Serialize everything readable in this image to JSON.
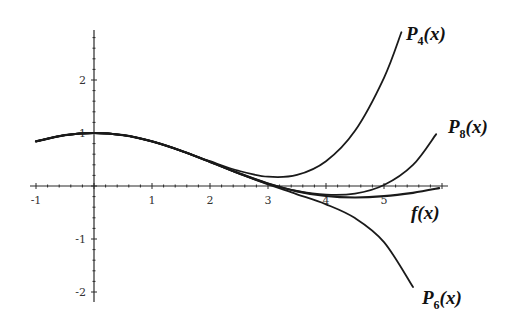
{
  "chart_data": {
    "type": "line",
    "title": "",
    "xlabel": "",
    "ylabel": "",
    "xlim": [
      -1,
      6
    ],
    "ylim": [
      -2,
      2.9
    ],
    "grid": false,
    "x_ticks": [
      -1,
      1,
      2,
      3,
      4,
      5
    ],
    "y_ticks": [
      2,
      1,
      -1,
      -2
    ],
    "x_tick_labels": [
      "-1",
      "1",
      "2",
      "3",
      "4",
      "5"
    ],
    "y_tick_labels": [
      "2",
      "1",
      "-1",
      "-2"
    ],
    "series": [
      {
        "name": "f(x)",
        "label_base": "f",
        "label_sub": "",
        "label_tail": "(x)",
        "x": [
          -1,
          -0.5,
          0,
          0.5,
          1,
          1.5,
          2,
          2.5,
          3,
          3.5,
          4,
          4.5,
          5,
          5.5,
          5.95
        ],
        "values": [
          0.841,
          0.959,
          1,
          0.959,
          0.841,
          0.665,
          0.455,
          0.239,
          0.047,
          -0.1,
          -0.189,
          -0.217,
          -0.192,
          -0.128,
          -0.04
        ]
      },
      {
        "name": "P4(x)",
        "label_base": "P",
        "label_sub": "4",
        "label_tail": "(x)",
        "x": [
          -1,
          -0.5,
          0,
          0.5,
          1,
          1.5,
          2,
          2.5,
          3,
          3.5,
          4,
          4.5,
          5,
          5.3
        ],
        "values": [
          0.842,
          0.959,
          1,
          0.959,
          0.842,
          0.667,
          0.467,
          0.284,
          0.175,
          0.209,
          0.467,
          1.042,
          2.042,
          2.9
        ]
      },
      {
        "name": "P6(x)",
        "label_base": "P",
        "label_sub": "6",
        "label_tail": "(x)",
        "x": [
          -1,
          -0.5,
          0,
          0.5,
          1,
          1.5,
          2,
          2.5,
          3,
          3.5,
          4,
          4.5,
          5,
          5.5
        ],
        "values": [
          0.841,
          0.959,
          1,
          0.959,
          0.841,
          0.665,
          0.454,
          0.234,
          0.03,
          -0.156,
          -0.346,
          -0.606,
          -1.058,
          -1.908
        ]
      },
      {
        "name": "P8(x)",
        "label_base": "P",
        "label_sub": "8",
        "label_tail": "(x)",
        "x": [
          -1,
          -0.5,
          0,
          0.5,
          1,
          1.5,
          2,
          2.5,
          3,
          3.5,
          4,
          4.5,
          5,
          5.5,
          5.9
        ],
        "values": [
          0.841,
          0.959,
          1,
          0.959,
          0.841,
          0.665,
          0.455,
          0.239,
          0.048,
          -0.094,
          -0.165,
          -0.143,
          0.018,
          0.399,
          0.98
        ]
      }
    ],
    "annotations": [
      {
        "text": "P4(x)",
        "attached_to": "P4(x)",
        "position": "upper-right end"
      },
      {
        "text": "P8(x)",
        "attached_to": "P8(x)",
        "position": "right end"
      },
      {
        "text": "f(x)",
        "attached_to": "f(x)",
        "position": "below right end"
      },
      {
        "text": "P6(x)",
        "attached_to": "P6(x)",
        "position": "lower-right end"
      }
    ],
    "legend": "none (inline curve labels)"
  },
  "layout": {
    "origin_px": [
      94,
      186
    ],
    "x_scale_px": 58,
    "y_scale_px": 53,
    "x_axis_px": [
      30,
      448
    ],
    "y_axis_px": [
      30,
      302
    ]
  },
  "labels": {
    "p4": {
      "base": "P",
      "sub": "4",
      "tail": "(x)",
      "x": 406,
      "y": 40
    },
    "p8": {
      "base": "P",
      "sub": "8",
      "tail": "(x)",
      "x": 448,
      "y": 133
    },
    "f": {
      "base": "f",
      "sub": "",
      "tail": "(x)",
      "x": 411,
      "y": 219
    },
    "p6": {
      "base": "P",
      "sub": "6",
      "tail": "(x)",
      "x": 422,
      "y": 304
    }
  }
}
